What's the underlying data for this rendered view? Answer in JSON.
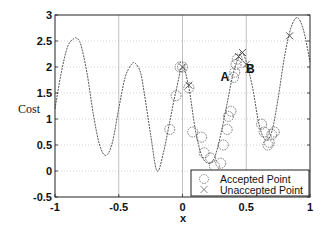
{
  "chart_data": {
    "type": "line",
    "title": "",
    "xlabel": "x",
    "ylabel": "Cost",
    "xlim": [
      -1,
      1
    ],
    "ylim": [
      -0.5,
      3
    ],
    "xticks": [
      "-1",
      "-0.5",
      "0",
      "0.5",
      "1"
    ],
    "yticks": [
      "-0.5",
      "0",
      "0.5",
      "1",
      "1.5",
      "2",
      "2.5",
      "3"
    ],
    "grid": true,
    "legend_position": "lower right",
    "curve": {
      "name": "Cost function",
      "x": [
        -1,
        -0.95,
        -0.9,
        -0.85,
        -0.83,
        -0.8,
        -0.75,
        -0.7,
        -0.65,
        -0.6,
        -0.55,
        -0.5,
        -0.45,
        -0.4,
        -0.37,
        -0.33,
        -0.3,
        -0.25,
        -0.2,
        -0.15,
        -0.1,
        -0.05,
        0,
        0.05,
        0.1,
        0.15,
        0.2,
        0.25,
        0.3,
        0.35,
        0.4,
        0.45,
        0.47,
        0.5,
        0.55,
        0.6,
        0.65,
        0.7,
        0.75,
        0.8,
        0.85,
        0.9,
        0.95,
        1
      ],
      "y": [
        1.2,
        1.9,
        2.4,
        2.55,
        2.55,
        2.45,
        1.9,
        1.1,
        0.5,
        0.3,
        0.55,
        1.2,
        1.8,
        2.05,
        2.07,
        1.9,
        1.5,
        0.7,
        0.0,
        0.35,
        0.95,
        1.55,
        2.0,
        1.6,
        0.8,
        0.3,
        0.15,
        0.25,
        0.7,
        1.3,
        1.9,
        2.25,
        2.28,
        2.1,
        1.6,
        0.9,
        0.6,
        0.75,
        1.4,
        2.2,
        2.75,
        2.95,
        2.7,
        2.1
      ]
    },
    "series": [
      {
        "name": "Accepted Point",
        "marker": "circle",
        "x": [
          -0.1,
          -0.05,
          -0.02,
          0.0,
          0.05,
          0.08,
          0.15,
          0.17,
          0.22,
          0.25,
          0.3,
          0.32,
          0.35,
          0.36,
          0.38,
          0.4,
          0.41,
          0.42,
          0.43,
          0.62,
          0.64,
          0.67,
          0.68,
          0.7,
          0.72
        ],
        "y": [
          0.8,
          1.45,
          2.0,
          2.0,
          1.6,
          0.75,
          0.65,
          0.35,
          0.25,
          0.1,
          0.15,
          0.5,
          0.8,
          1.05,
          1.15,
          1.8,
          1.9,
          2.05,
          2.15,
          0.9,
          0.75,
          0.5,
          0.55,
          0.7,
          0.75
        ]
      },
      {
        "name": "Unaccepted Point",
        "marker": "x",
        "x": [
          0.0,
          0.05,
          0.44,
          0.47,
          0.5,
          0.52,
          0.84
        ],
        "y": [
          2.0,
          1.65,
          2.2,
          2.28,
          2.05,
          1.95,
          2.6
        ]
      }
    ],
    "annotations": [
      {
        "text": "A",
        "x": 0.36,
        "y": 1.8
      },
      {
        "text": "B",
        "x": 0.56,
        "y": 1.97
      }
    ]
  },
  "legend": {
    "accepted_label": "Accepted Point",
    "unaccepted_label": "Unaccepted Point"
  }
}
